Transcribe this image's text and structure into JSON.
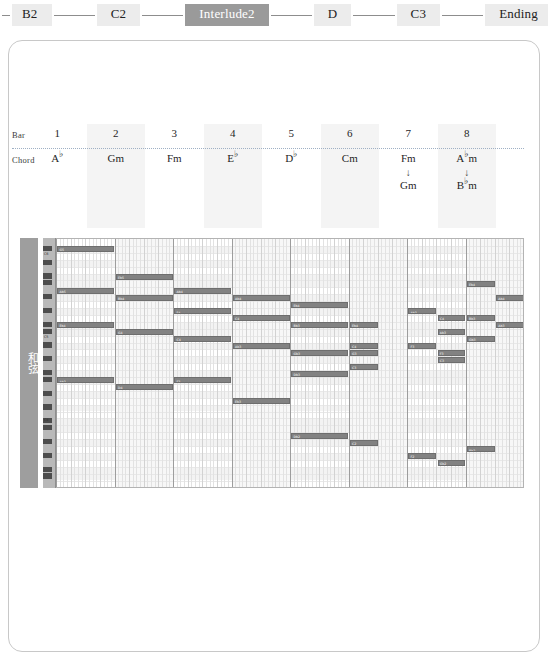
{
  "section_nav": {
    "segments": [
      {
        "label": "B2",
        "active": false
      },
      {
        "label": "C2",
        "active": false
      },
      {
        "label": "Interlude2",
        "active": true
      },
      {
        "label": "D",
        "active": false
      },
      {
        "label": "C3",
        "active": false
      },
      {
        "label": "Ending",
        "active": false
      }
    ],
    "active_label": "Interlude2",
    "active_bg": "#9a9a9a",
    "inactive_bg": "#ececec"
  },
  "chord_table": {
    "row_labels": {
      "bar": "Bar",
      "chord": "Chord"
    },
    "bars": [
      {
        "number": "1",
        "chord_root": "A",
        "chord_accidental": "♭",
        "chord_suffix": "",
        "second_root": "",
        "second_accidental": "",
        "second_suffix": "",
        "shaded": false
      },
      {
        "number": "2",
        "chord_root": "G",
        "chord_accidental": "",
        "chord_suffix": "m",
        "second_root": "",
        "second_accidental": "",
        "second_suffix": "",
        "shaded": true
      },
      {
        "number": "3",
        "chord_root": "F",
        "chord_accidental": "",
        "chord_suffix": "m",
        "second_root": "",
        "second_accidental": "",
        "second_suffix": "",
        "shaded": false
      },
      {
        "number": "4",
        "chord_root": "E",
        "chord_accidental": "♭",
        "chord_suffix": "",
        "second_root": "",
        "second_accidental": "",
        "second_suffix": "",
        "shaded": true
      },
      {
        "number": "5",
        "chord_root": "D",
        "chord_accidental": "♭",
        "chord_suffix": "",
        "second_root": "",
        "second_accidental": "",
        "second_suffix": "",
        "shaded": false
      },
      {
        "number": "6",
        "chord_root": "C",
        "chord_accidental": "",
        "chord_suffix": "m",
        "second_root": "",
        "second_accidental": "",
        "second_suffix": "",
        "shaded": true
      },
      {
        "number": "7",
        "chord_root": "F",
        "chord_accidental": "",
        "chord_suffix": "m",
        "second_root": "G",
        "second_accidental": "",
        "second_suffix": "m",
        "shaded": false
      },
      {
        "number": "8",
        "chord_root": "A",
        "chord_accidental": "♭",
        "chord_suffix": "m",
        "second_root": "B",
        "second_accidental": "♭",
        "second_suffix": "m",
        "shaded": true
      }
    ],
    "arrow_glyph": "↓"
  },
  "piano_roll": {
    "side_label": "和弦",
    "bar_count": 8,
    "beats_per_bar": 4,
    "row_count": 36,
    "row_height": 6.9,
    "bar_width": 58.5,
    "octave_marks": [
      {
        "row": 2,
        "label": "C6"
      },
      {
        "row": 14,
        "label": "C5"
      },
      {
        "row": 26,
        "label": "C4"
      }
    ],
    "black_key_rows": [
      1,
      3,
      5,
      6,
      8,
      10,
      12,
      13,
      15,
      17,
      19,
      20,
      22,
      24,
      26,
      27,
      29,
      31,
      33,
      34
    ],
    "notes": [
      {
        "label": "G5",
        "row": 1,
        "start_bar": 0,
        "start_beat": 0.1,
        "length_beats": 3.9
      },
      {
        "label": "Eb5",
        "row": 5,
        "start_bar": 1,
        "start_beat": 0.1,
        "length_beats": 3.9
      },
      {
        "label": "Ab5",
        "row": 7,
        "start_bar": 0,
        "start_beat": 0.1,
        "length_beats": 3.9
      },
      {
        "label": "Bb4",
        "row": 8,
        "start_bar": 1,
        "start_beat": 0.1,
        "length_beats": 3.9
      },
      {
        "label": "Eb4",
        "row": 12,
        "start_bar": 0,
        "start_beat": 0.1,
        "length_beats": 3.9
      },
      {
        "label": "G4",
        "row": 13,
        "start_bar": 1,
        "start_beat": 0.1,
        "length_beats": 3.9
      },
      {
        "label": "Ab3",
        "row": 20,
        "start_bar": 0,
        "start_beat": 0.1,
        "length_beats": 3.9
      },
      {
        "label": "D4",
        "row": 21,
        "start_bar": 1,
        "start_beat": 0.1,
        "length_beats": 3.9
      },
      {
        "label": "Ab4",
        "row": 7,
        "start_bar": 2,
        "start_beat": 0.1,
        "length_beats": 3.9
      },
      {
        "label": "Ab4",
        "row": 8,
        "start_bar": 3,
        "start_beat": 0.1,
        "length_beats": 3.9
      },
      {
        "label": "F4",
        "row": 10,
        "start_bar": 2,
        "start_beat": 0.1,
        "length_beats": 3.9
      },
      {
        "label": "C4",
        "row": 11,
        "start_bar": 3,
        "start_beat": 0.1,
        "length_beats": 3.9
      },
      {
        "label": "C4",
        "row": 14,
        "start_bar": 2,
        "start_beat": 0.1,
        "length_beats": 3.9
      },
      {
        "label": "Ab3",
        "row": 15,
        "start_bar": 3,
        "start_beat": 0.1,
        "length_beats": 3.9
      },
      {
        "label": "F3",
        "row": 20,
        "start_bar": 2,
        "start_beat": 0.1,
        "length_beats": 3.9
      },
      {
        "label": "Eb3",
        "row": 23,
        "start_bar": 3,
        "start_beat": 0.1,
        "length_beats": 3.9
      },
      {
        "label": "Eb4",
        "row": 9,
        "start_bar": 4,
        "start_beat": 0.1,
        "length_beats": 3.9
      },
      {
        "label": "Bb3",
        "row": 12,
        "start_bar": 4,
        "start_beat": 0.1,
        "length_beats": 3.9
      },
      {
        "label": "Gb3",
        "row": 16,
        "start_bar": 4,
        "start_beat": 0.1,
        "length_beats": 3.9
      },
      {
        "label": "Db3",
        "row": 19,
        "start_bar": 4,
        "start_beat": 0.1,
        "length_beats": 3.9
      },
      {
        "label": "Db2",
        "row": 28,
        "start_bar": 4,
        "start_beat": 0.1,
        "length_beats": 3.9
      },
      {
        "label": "Eb4",
        "row": 12,
        "start_bar": 5,
        "start_beat": 0.1,
        "length_beats": 1.9
      },
      {
        "label": "C4",
        "row": 15,
        "start_bar": 5,
        "start_beat": 0.1,
        "length_beats": 1.9
      },
      {
        "label": "G3",
        "row": 16,
        "start_bar": 5,
        "start_beat": 0.1,
        "length_beats": 1.9
      },
      {
        "label": "C3",
        "row": 18,
        "start_bar": 5,
        "start_beat": 0.1,
        "length_beats": 1.9
      },
      {
        "label": "C2",
        "row": 29,
        "start_bar": 5,
        "start_beat": 0.1,
        "length_beats": 1.9
      },
      {
        "label": "Ab3",
        "row": 10,
        "start_bar": 6,
        "start_beat": 0.1,
        "length_beats": 1.9
      },
      {
        "label": "C4",
        "row": 11,
        "start_bar": 6,
        "start_beat": 2.1,
        "length_beats": 1.9
      },
      {
        "label": "Ab3",
        "row": 13,
        "start_bar": 6,
        "start_beat": 2.1,
        "length_beats": 1.9
      },
      {
        "label": "F3",
        "row": 15,
        "start_bar": 6,
        "start_beat": 0.1,
        "length_beats": 1.9
      },
      {
        "label": "F3",
        "row": 16,
        "start_bar": 6,
        "start_beat": 2.1,
        "length_beats": 1.9
      },
      {
        "label": "C3",
        "row": 17,
        "start_bar": 6,
        "start_beat": 2.1,
        "length_beats": 1.9
      },
      {
        "label": "F2",
        "row": 31,
        "start_bar": 6,
        "start_beat": 0.1,
        "length_beats": 1.9
      },
      {
        "label": "Gb2",
        "row": 32,
        "start_bar": 6,
        "start_beat": 2.1,
        "length_beats": 1.9
      },
      {
        "label": "Eb4",
        "row": 6,
        "start_bar": 7,
        "start_beat": 0.1,
        "length_beats": 1.9
      },
      {
        "label": "Ab4",
        "row": 8,
        "start_bar": 7,
        "start_beat": 2.1,
        "length_beats": 1.9
      },
      {
        "label": "Bb3",
        "row": 11,
        "start_bar": 7,
        "start_beat": 0.1,
        "length_beats": 1.9
      },
      {
        "label": "Ab3",
        "row": 12,
        "start_bar": 7,
        "start_beat": 2.1,
        "length_beats": 1.9
      },
      {
        "label": "Gb3",
        "row": 14,
        "start_bar": 7,
        "start_beat": 0.1,
        "length_beats": 1.9
      },
      {
        "label": "Bb2",
        "row": 30,
        "start_bar": 7,
        "start_beat": 0.1,
        "length_beats": 1.9
      }
    ]
  }
}
